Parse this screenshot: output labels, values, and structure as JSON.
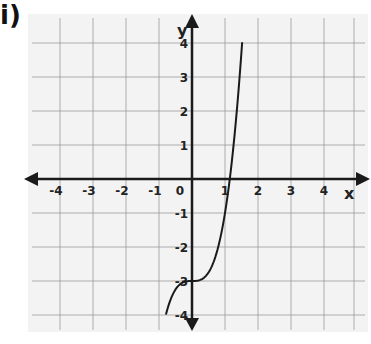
{
  "problem_label": "i)",
  "colors": {
    "paper": "#f3f3f3",
    "grid": "#9a9a9a",
    "axis": "#1a1a1a",
    "curve": "#1a1a1a"
  },
  "chart_data": {
    "type": "line",
    "title": "",
    "xlabel": "x",
    "ylabel": "y",
    "xlim": [
      -4,
      4
    ],
    "ylim": [
      -4,
      4
    ],
    "grid": true,
    "x_ticks": [
      "-4",
      "-3",
      "-2",
      "-1",
      "0",
      "1",
      "2",
      "3",
      "4"
    ],
    "y_ticks": [
      "4",
      "3",
      "2",
      "1",
      "-1",
      "-2",
      "-3",
      "-4"
    ],
    "series": [
      {
        "name": "y = 2x^3 - 3",
        "function": "2x^3 - 3",
        "x": [
          -0.79,
          -0.6,
          -0.4,
          -0.2,
          0,
          0.2,
          0.4,
          0.6,
          0.8,
          1.0,
          1.14,
          1.3,
          1.52
        ],
        "y": [
          -4.0,
          -3.43,
          -3.13,
          -3.02,
          -3.0,
          -2.98,
          -2.87,
          -2.57,
          -1.98,
          -1.0,
          0.0,
          1.39,
          4.0
        ]
      }
    ],
    "annotations": [
      "inflection point at (0, -3)",
      "x-intercept near x ≈ 1.14"
    ]
  }
}
